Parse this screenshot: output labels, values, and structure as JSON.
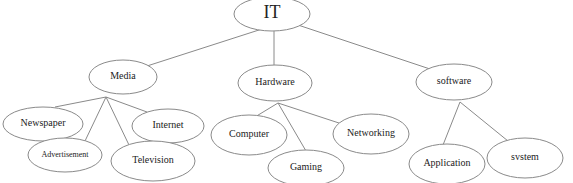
{
  "diagram": {
    "type": "tree",
    "root": {
      "id": "it",
      "label": "IT",
      "cx": 272,
      "cy": 14,
      "rx": 38,
      "ry": 17
    },
    "categories": [
      {
        "id": "media",
        "label": "Media",
        "cx": 123,
        "cy": 77,
        "rx": 34,
        "ry": 17
      },
      {
        "id": "hardware",
        "label": "Hardware",
        "cx": 275,
        "cy": 83,
        "rx": 37,
        "ry": 18
      },
      {
        "id": "software",
        "label": "software",
        "cx": 454,
        "cy": 82,
        "rx": 38,
        "ry": 18
      }
    ],
    "leaves": [
      {
        "id": "newspaper",
        "parent": "media",
        "label": "Newspaper",
        "cx": 43,
        "cy": 124,
        "rx": 40,
        "ry": 17
      },
      {
        "id": "advertisement",
        "parent": "media",
        "label": "Advertisement",
        "cx": 65,
        "cy": 155,
        "rx": 37,
        "ry": 17
      },
      {
        "id": "internet",
        "parent": "media",
        "label": "Internet",
        "cx": 168,
        "cy": 126,
        "rx": 36,
        "ry": 17
      },
      {
        "id": "television",
        "parent": "media",
        "label": "Television",
        "cx": 153,
        "cy": 161,
        "rx": 42,
        "ry": 20
      },
      {
        "id": "computer",
        "parent": "hardware",
        "label": "Computer",
        "cx": 249,
        "cy": 135,
        "rx": 38,
        "ry": 20
      },
      {
        "id": "gaming",
        "parent": "hardware",
        "label": "Gaming",
        "cx": 306,
        "cy": 168,
        "rx": 38,
        "ry": 18
      },
      {
        "id": "networking",
        "parent": "hardware",
        "label": "Networking",
        "cx": 371,
        "cy": 134,
        "rx": 38,
        "ry": 20
      },
      {
        "id": "application",
        "parent": "software",
        "label": "Application",
        "cx": 447,
        "cy": 164,
        "rx": 38,
        "ry": 20
      },
      {
        "id": "system",
        "parent": "software",
        "label": "svstem",
        "cx": 525,
        "cy": 158,
        "rx": 38,
        "ry": 20
      }
    ],
    "edges": [
      {
        "from": "it",
        "to": "media",
        "x1": 262,
        "y1": 29,
        "x2": 147,
        "y2": 66
      },
      {
        "from": "it",
        "to": "hardware",
        "x1": 274,
        "y1": 31,
        "x2": 274,
        "y2": 65
      },
      {
        "from": "it",
        "to": "software",
        "x1": 298,
        "y1": 25,
        "x2": 436,
        "y2": 71
      },
      {
        "from": "media",
        "to": "newspaper",
        "x1": 106,
        "y1": 97,
        "x2": 55,
        "y2": 107
      },
      {
        "from": "media",
        "to": "advertisement",
        "x1": 106,
        "y1": 97,
        "x2": 85,
        "y2": 141
      },
      {
        "from": "media",
        "to": "internet",
        "x1": 106,
        "y1": 97,
        "x2": 147,
        "y2": 112
      },
      {
        "from": "media",
        "to": "television",
        "x1": 106,
        "y1": 97,
        "x2": 129,
        "y2": 145
      },
      {
        "from": "hardware",
        "to": "computer",
        "x1": 278,
        "y1": 103,
        "x2": 250,
        "y2": 120
      },
      {
        "from": "hardware",
        "to": "gaming",
        "x1": 278,
        "y1": 103,
        "x2": 306,
        "y2": 151
      },
      {
        "from": "hardware",
        "to": "networking",
        "x1": 278,
        "y1": 103,
        "x2": 342,
        "y2": 124
      },
      {
        "from": "software",
        "to": "application",
        "x1": 460,
        "y1": 102,
        "x2": 443,
        "y2": 145
      },
      {
        "from": "software",
        "to": "system",
        "x1": 460,
        "y1": 102,
        "x2": 508,
        "y2": 141
      }
    ]
  },
  "colors": {
    "stroke": "#8a8a8a",
    "text": "#222222",
    "background": "#ffffff"
  }
}
